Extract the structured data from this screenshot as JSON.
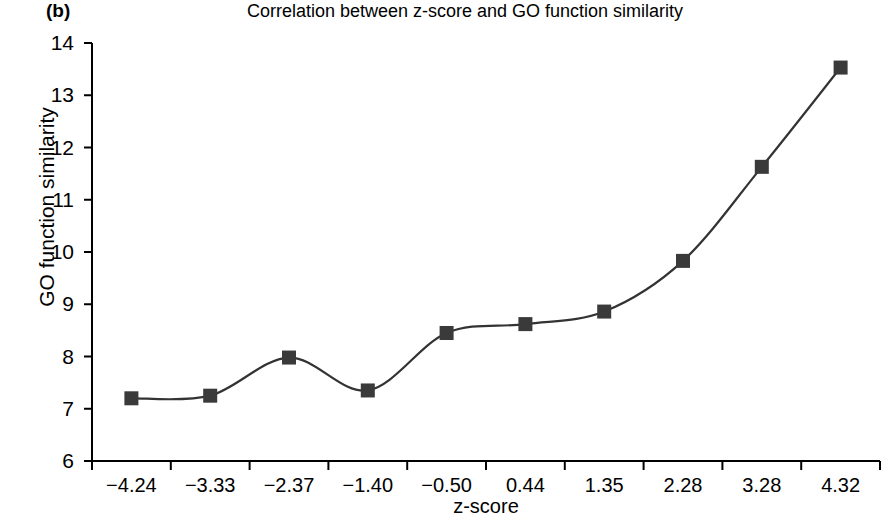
{
  "figure": {
    "panel_label": "(b)",
    "title": "Correlation between z-score and GO function similarity",
    "background": "#ffffff",
    "line_color": "#333333",
    "marker_color": "#3a3a3a",
    "axis_color": "#000000"
  },
  "chart_data": {
    "type": "line",
    "title": "Correlation between z-score and GO function similarity",
    "xlabel": "z-score",
    "ylabel": "GO function similarity",
    "categories": [
      "−4.24",
      "−3.33",
      "−2.37",
      "−1.40",
      "−0.50",
      "0.44",
      "1.35",
      "2.28",
      "3.28",
      "4.32"
    ],
    "values": [
      7.2,
      7.25,
      7.98,
      7.35,
      8.45,
      8.62,
      8.86,
      9.83,
      11.63,
      13.53
    ],
    "series": [
      {
        "name": "GO function similarity",
        "values": [
          7.2,
          7.25,
          7.98,
          7.35,
          8.45,
          8.62,
          8.86,
          9.83,
          11.63,
          13.53
        ],
        "marker": "square",
        "smoothed": true
      }
    ],
    "ylim": [
      6,
      14
    ],
    "yticks": [
      "6",
      "7",
      "8",
      "9",
      "10",
      "11",
      "12",
      "13",
      "14"
    ],
    "grid": false,
    "legend": "none"
  }
}
